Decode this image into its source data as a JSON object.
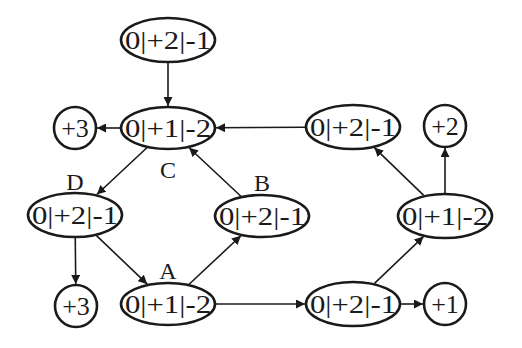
{
  "diagram": {
    "type": "state-graph",
    "nodes": [
      {
        "id": "top",
        "label": "0|+2|-1",
        "shape": "ellipse",
        "cx": 168,
        "cy": 40,
        "rx": 47,
        "ry": 22
      },
      {
        "id": "C",
        "label": "0|+1|-2",
        "tag": "C",
        "shape": "ellipse",
        "cx": 168,
        "cy": 128,
        "rx": 47,
        "ry": 21
      },
      {
        "id": "out_C",
        "label": "+3",
        "shape": "circle",
        "cx": 75,
        "cy": 128,
        "r": 21
      },
      {
        "id": "D",
        "label": "0|+2|-1",
        "tag": "D",
        "shape": "ellipse",
        "cx": 75,
        "cy": 215,
        "rx": 47,
        "ry": 22
      },
      {
        "id": "out_D",
        "label": "+3",
        "shape": "circle",
        "cx": 76,
        "cy": 306,
        "r": 21
      },
      {
        "id": "A",
        "label": "0|+1|-2",
        "tag": "A",
        "shape": "ellipse",
        "cx": 168,
        "cy": 304,
        "rx": 47,
        "ry": 21
      },
      {
        "id": "B",
        "label": "0|+2|-1",
        "tag": "B",
        "shape": "ellipse",
        "cx": 262,
        "cy": 216,
        "rx": 47,
        "ry": 21
      },
      {
        "id": "R1",
        "label": "0|+2|-1",
        "shape": "ellipse",
        "cx": 353,
        "cy": 127,
        "rx": 47,
        "ry": 22
      },
      {
        "id": "out_R1",
        "label": "+2",
        "shape": "circle",
        "cx": 445,
        "cy": 126,
        "r": 21
      },
      {
        "id": "R2",
        "label": "0|+1|-2",
        "shape": "ellipse",
        "cx": 445,
        "cy": 216,
        "rx": 47,
        "ry": 22
      },
      {
        "id": "R3",
        "label": "0|+2|-1",
        "shape": "ellipse",
        "cx": 353,
        "cy": 304,
        "rx": 47,
        "ry": 22
      },
      {
        "id": "out_R3",
        "label": "+1",
        "shape": "circle",
        "cx": 445,
        "cy": 304,
        "r": 21
      }
    ],
    "tags": [
      {
        "text": "C",
        "x": 168,
        "y": 178
      },
      {
        "text": "D",
        "x": 75,
        "y": 190
      },
      {
        "text": "A",
        "x": 168,
        "y": 279
      },
      {
        "text": "B",
        "x": 262,
        "y": 191
      }
    ],
    "edges": [
      {
        "from": "top",
        "to": "C"
      },
      {
        "from": "C",
        "to": "out_C"
      },
      {
        "from": "C",
        "to": "D"
      },
      {
        "from": "D",
        "to": "out_D"
      },
      {
        "from": "D",
        "to": "A"
      },
      {
        "from": "A",
        "to": "B"
      },
      {
        "from": "B",
        "to": "C"
      },
      {
        "from": "R1",
        "to": "C"
      },
      {
        "from": "A",
        "to": "R3"
      },
      {
        "from": "R3",
        "to": "out_R3"
      },
      {
        "from": "R3",
        "to": "R2"
      },
      {
        "from": "R2",
        "to": "R1"
      },
      {
        "from": "R2",
        "to": "out_R1"
      }
    ],
    "colors": {
      "stroke": "#1a1a1a",
      "background": "#ffffff"
    }
  }
}
